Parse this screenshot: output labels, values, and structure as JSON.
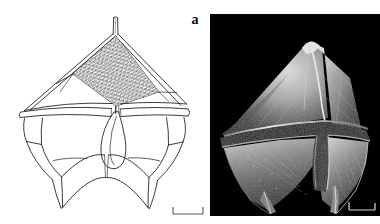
{
  "figure": {
    "panel_label": "a",
    "background_color": "#ffffff",
    "width": 380,
    "height": 224
  },
  "panels": [
    {
      "id": "line-drawing",
      "kind": "line-drawing",
      "name": "dinoflagellate-line-drawing",
      "background_color": "#ffffff",
      "stroke_color": "#1a1a1a",
      "description": "Ventral line drawing of an armoured dinoflagellate theca showing apical horn, epitheca with stippled apical plate, cingulum, sulcus with flagellar pore and two antapical spines."
    },
    {
      "id": "sem",
      "kind": "electron-micrograph",
      "name": "dinoflagellate-sem-micrograph",
      "background_color": "#000000",
      "highlight_color": "#e8e8e8",
      "description": "Scanning electron micrograph of the same dinoflagellate cell, ventral view, bright thecal plates on black background."
    }
  ],
  "scalebars": [
    {
      "id": "scalebar-line-drawing",
      "color": "#4a4a4a",
      "orientation": "horizontal-with-end-ticks"
    },
    {
      "id": "scalebar-sem",
      "color": "#d8d8d8",
      "orientation": "horizontal-with-end-ticks"
    }
  ],
  "colors": {
    "page_background": "#ffffff",
    "drawing_ink": "#1a1a1a",
    "sem_background": "#000000",
    "sem_highlight": "#ffffff",
    "label_ink": "#0a0a0a"
  }
}
